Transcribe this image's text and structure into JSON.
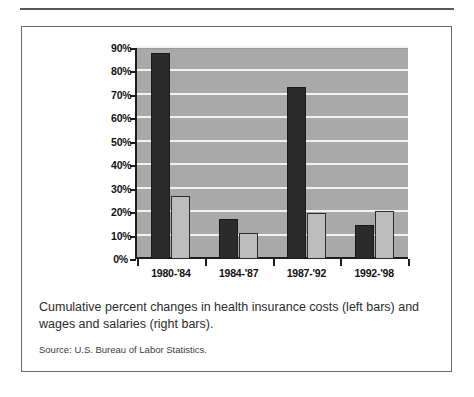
{
  "figure": {
    "caption": "Cumulative percent changes in health insurance costs (left bars) and wages and salaries (right bars).",
    "source": "Source:  U.S. Bureau of Labor Statistics.",
    "ghost_text": "",
    "colors": {
      "plot_background": "#a9a9a9",
      "gridline": "#f2f2f2",
      "bar_dark": "#2b2b2b",
      "bar_light": "#bdbdbd",
      "axis": "#1d1d1d",
      "frame": "#6a6d70"
    }
  },
  "chart_data": {
    "type": "bar",
    "title": "",
    "xlabel": "",
    "ylabel": "",
    "categories": [
      "1980-'84",
      "1984-'87",
      "1987-'92",
      "1992-'98"
    ],
    "series": [
      {
        "name": "Health insurance costs (left bars)",
        "values": [
          88,
          17,
          73.5,
          14.5
        ]
      },
      {
        "name": "Wages and salaries (right bars)",
        "values": [
          27,
          11,
          19.5,
          20.5
        ]
      }
    ],
    "ylim": [
      0,
      90
    ],
    "yticks": [
      0,
      10,
      20,
      30,
      40,
      50,
      60,
      70,
      80,
      90
    ],
    "ytick_labels": [
      "0%",
      "10%",
      "20%",
      "30%",
      "40%",
      "50%",
      "60%",
      "70%",
      "80%",
      "90%"
    ],
    "grid": true,
    "legend": "none"
  }
}
